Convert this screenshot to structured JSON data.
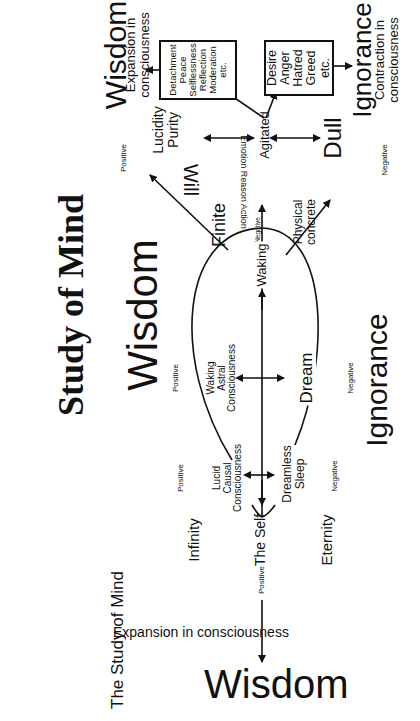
{
  "title": "Study of Mind",
  "caption": "The Study of Mind",
  "labels": {
    "wisdom_top": "Wisdom",
    "expansion_top": "Expansion in\nconsciousness",
    "ignorance_top": "Ignorance",
    "contraction": "Contraction in\nconsciousness",
    "wisdom_mid": "Wisdom",
    "ignorance_mid": "Ignorance",
    "wisdom_bottom": "Wisdom",
    "expansion_bottom": "Expansion in consciousness",
    "lucidity_purity": "Lucidity\nPurity",
    "agitated": "Agitated",
    "dull": "Dull",
    "will": "Will",
    "emotion_reason_action": "Emotion Reason Action",
    "finite": "Finite",
    "physical_concrete": "Physical\nconcrete",
    "waking": "Waking",
    "waking_astral": "Waking\nAstral\nConsciousness",
    "dream": "Dream",
    "lucid_causal": "Lucid\nCausal\nConsciousness",
    "dreamless_sleep": "Dreamless\nSleep",
    "infinity": "Infinity",
    "the_self": "The Self",
    "eternity": "Eternity",
    "positive": "Positive",
    "negative": "Negative"
  },
  "boxes": {
    "virtues": [
      "Detachment",
      "Peace",
      "Selflessness",
      "Reflection",
      "Moderation",
      "etc."
    ],
    "vices": [
      "Desire",
      "Anger",
      "Hatred",
      "Greed",
      "etc."
    ]
  }
}
